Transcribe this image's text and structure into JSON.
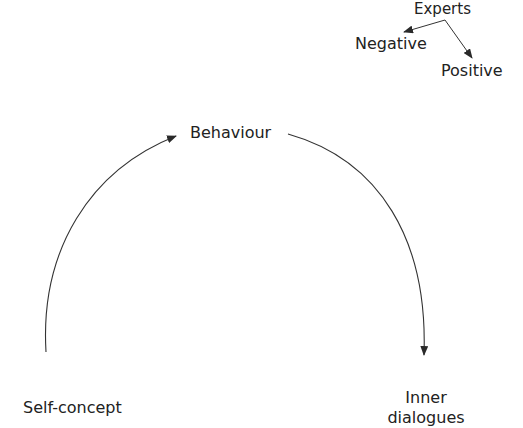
{
  "diagram": {
    "type": "cycle",
    "nodes": {
      "experts": "Experts",
      "negative": "Negative",
      "positive": "Positive",
      "behaviour": "Behaviour",
      "self_concept": "Self-concept",
      "inner_line1": "Inner",
      "inner_line2": "dialogues"
    },
    "edges": [
      {
        "from": "Experts",
        "to": "Negative"
      },
      {
        "from": "Experts",
        "to": "Positive"
      },
      {
        "from": "Self-concept",
        "to": "Behaviour"
      },
      {
        "from": "Behaviour",
        "to": "Inner dialogues"
      }
    ],
    "colors": {
      "stroke": "#333333",
      "text": "#222222",
      "background": "#ffffff"
    }
  }
}
